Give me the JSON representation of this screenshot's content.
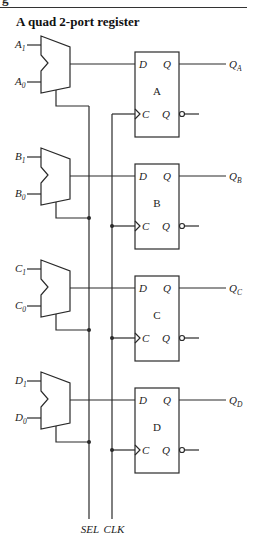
{
  "header": {
    "cut_text": "g",
    "title": "A quad 2-port register"
  },
  "diagram": {
    "type": "logic-circuit",
    "signals": {
      "select_label": "SEL",
      "clock_label": "CLK"
    },
    "stages": [
      {
        "id": "A",
        "ff_label": "A",
        "input1": {
          "letter": "A",
          "sub": "1"
        },
        "input0": {
          "letter": "A",
          "sub": "0"
        },
        "output": {
          "letter": "Q",
          "sub": "A"
        },
        "pin_d": "D",
        "pin_c": "C",
        "pin_q": "Q",
        "pin_qn": "Q"
      },
      {
        "id": "B",
        "ff_label": "B",
        "input1": {
          "letter": "B",
          "sub": "1"
        },
        "input0": {
          "letter": "B",
          "sub": "0"
        },
        "output": {
          "letter": "Q",
          "sub": "B"
        },
        "pin_d": "D",
        "pin_c": "C",
        "pin_q": "Q",
        "pin_qn": "Q"
      },
      {
        "id": "C",
        "ff_label": "C",
        "input1": {
          "letter": "C",
          "sub": "1"
        },
        "input0": {
          "letter": "C",
          "sub": "0"
        },
        "output": {
          "letter": "Q",
          "sub": "C"
        },
        "pin_d": "D",
        "pin_c": "C",
        "pin_q": "Q",
        "pin_qn": "Q"
      },
      {
        "id": "D",
        "ff_label": "D",
        "input1": {
          "letter": "D",
          "sub": "1"
        },
        "input0": {
          "letter": "D",
          "sub": "0"
        },
        "output": {
          "letter": "Q",
          "sub": "D"
        },
        "pin_d": "D",
        "pin_c": "C",
        "pin_q": "Q",
        "pin_qn": "Q"
      }
    ],
    "colors": {
      "line": "#2a2a2a",
      "background": "#ffffff"
    }
  }
}
